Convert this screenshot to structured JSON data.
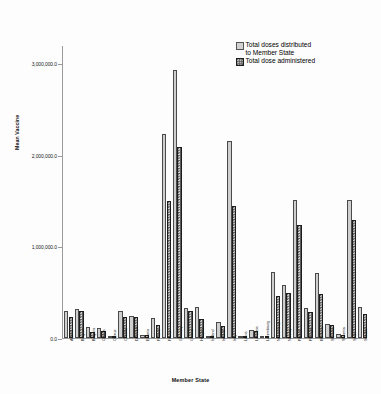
{
  "chart_data": {
    "type": "bar",
    "title": "",
    "xlabel": "Member State",
    "ylabel": "Mean Vaccine",
    "ylim": [
      0,
      3200000
    ],
    "yticks": [
      0,
      1000000,
      2000000,
      3000000
    ],
    "ytick_labels": [
      "0.0",
      "1,000,000.0",
      "2,000,000.0",
      "3,000,000.0"
    ],
    "grid": false,
    "legend_position": "top-right",
    "categories": [
      "Austria",
      "Belgium",
      "Bulgaria",
      "Croatia",
      "Cyprus",
      "Czechia",
      "Denmark",
      "Estonia",
      "Finland",
      "France",
      "Germany",
      "Greece",
      "Hungary",
      "Iceland",
      "Ireland",
      "Italy",
      "Latvia",
      "Lithuania",
      "Luxembourg",
      "Netherlands",
      "Norway",
      "Poland",
      "Portugal",
      "Romania",
      "Slovakia",
      "Slovenia",
      "Spain",
      "Sweden"
    ],
    "series": [
      {
        "name": "Total doses distributed to Member State",
        "color": "#cfcfcf",
        "values": [
          300000,
          320000,
          115000,
          105000,
          25000,
          300000,
          235000,
          30000,
          215000,
          2230000,
          2930000,
          330000,
          340000,
          12000,
          170000,
          2150000,
          22000,
          88000,
          10000,
          720000,
          580000,
          1510000,
          330000,
          710000,
          155000,
          48000,
          1510000,
          335000
        ]
      },
      {
        "name": "Total dose administered",
        "color": "#5a5a5a",
        "values": [
          230000,
          290000,
          65000,
          72000,
          18000,
          225000,
          228000,
          28000,
          142000,
          1500000,
          2090000,
          300000,
          205000,
          9000,
          130000,
          1440000,
          15000,
          75000,
          6000,
          460000,
          490000,
          1230000,
          285000,
          480000,
          140000,
          38000,
          1285000,
          265000
        ]
      }
    ]
  },
  "legend": {
    "items": [
      {
        "label_line1": "Total doses distributed",
        "label_line2": "to Member State",
        "swatch": "distributed"
      },
      {
        "label_line1": "Total dose administered",
        "label_line2": "",
        "swatch": "administered"
      }
    ]
  },
  "axes": {
    "y_title": "Mean Vaccine",
    "x_title": "Member State"
  }
}
